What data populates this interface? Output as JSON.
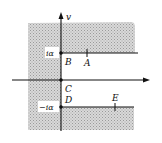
{
  "diagram": {
    "type": "complex-plane-contour",
    "axis_labels": {
      "vertical": "v"
    },
    "points": [
      {
        "id": "A",
        "label": "A"
      },
      {
        "id": "B",
        "label": "B"
      },
      {
        "id": "C",
        "label": "C"
      },
      {
        "id": "D",
        "label": "D"
      },
      {
        "id": "E",
        "label": "E"
      }
    ],
    "values": {
      "upper": "iα",
      "lower": "−iα"
    },
    "colors": {
      "shade": "#c8c8c8",
      "line": "#111111",
      "background": "#ffffff"
    }
  }
}
